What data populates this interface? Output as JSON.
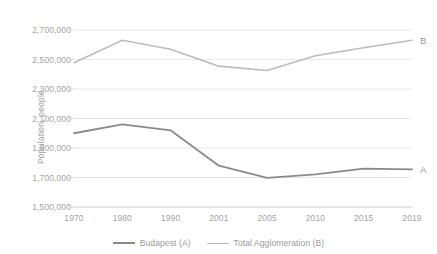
{
  "chart_data": {
    "type": "line",
    "title": "",
    "subtitle": "",
    "xlabel": "",
    "ylabel": "Population, people",
    "categories": [
      "1970",
      "1980",
      "1990",
      "2001",
      "2005",
      "2010",
      "2015",
      "2019"
    ],
    "x": [
      1970,
      1980,
      1990,
      2001,
      2005,
      2010,
      2015,
      2019
    ],
    "ylim": [
      1500000,
      2700000
    ],
    "ytick_labels": [
      "1,500,000",
      "1,700,000",
      "1,900,000",
      "2,100,000",
      "2,300,000",
      "2,500,000",
      "2,700,000"
    ],
    "ytick_values": [
      1500000,
      1700000,
      1900000,
      2100000,
      2300000,
      2500000,
      2700000
    ],
    "grid": true,
    "grid_axis": "y",
    "legend_position": "bottom",
    "series": [
      {
        "name": "Budapest (A)",
        "end_label": "A",
        "color": "#8a8a8a",
        "width": 1.8,
        "values": [
          2000000,
          2060000,
          2020000,
          1780000,
          1697000,
          1721000,
          1760000,
          1755000
        ]
      },
      {
        "name": "Total Agglomeration (B)",
        "end_label": "B",
        "color": "#bcbcbc",
        "width": 1.6,
        "values": [
          2478000,
          2630000,
          2570000,
          2455000,
          2425000,
          2525000,
          2580000,
          2630000
        ]
      }
    ]
  },
  "legend": {
    "items": [
      {
        "label": "Budapest (A)",
        "color": "#8a8a8a"
      },
      {
        "label": "Total Agglomeration (B)",
        "color": "#bcbcbc"
      }
    ]
  },
  "colors": {
    "series_a": "#8a8a8a",
    "series_b": "#bcbcbc",
    "grid": "#e8e8e8",
    "axis": "#d9d9d9",
    "text": "#a3a3a3",
    "background": "#ffffff"
  }
}
